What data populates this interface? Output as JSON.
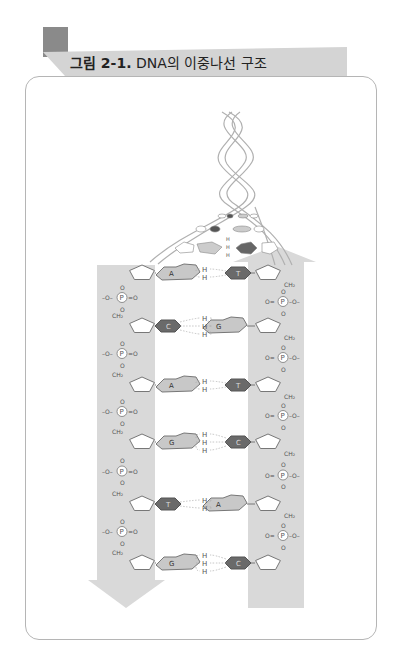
{
  "figure": {
    "label": "그림 2-1.",
    "title": "DNA의 이중나선 구조"
  },
  "colors": {
    "tab_block": "#8a8a8a",
    "title_band": "#d4d4d4",
    "card_border": "#b5b5b5",
    "strand_band": "#d9d9d9",
    "purine_fill": "#c8c8c8",
    "pyrimidine_fill": "#6a6a6a"
  },
  "diagram": {
    "left_strand_direction": "down",
    "right_strand_direction": "up",
    "backbone_labels": {
      "phosphate": "P",
      "ch2": "CH₂",
      "oxygen": "O",
      "hydrogen": "H"
    },
    "base_pairs": [
      {
        "left": "A",
        "right": "T",
        "hydrogen_bonds": 2
      },
      {
        "left": "C",
        "right": "G",
        "hydrogen_bonds": 3
      },
      {
        "left": "A",
        "right": "T",
        "hydrogen_bonds": 2
      },
      {
        "left": "G",
        "right": "C",
        "hydrogen_bonds": 3
      },
      {
        "left": "T",
        "right": "A",
        "hydrogen_bonds": 2
      },
      {
        "left": "G",
        "right": "C",
        "hydrogen_bonds": 3
      }
    ]
  }
}
